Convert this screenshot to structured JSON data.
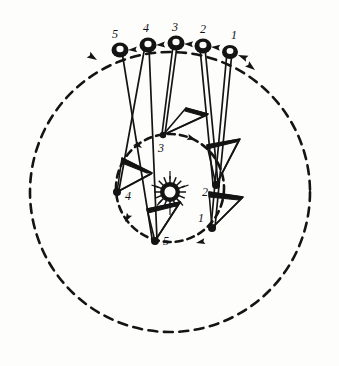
{
  "figure": {
    "background_color": "#fdfdfc",
    "ink_color": "#141414",
    "center": {
      "x": 170,
      "y": 192,
      "label": "sun-starburst"
    },
    "outer_orbit": {
      "name": "outer-dashed-orbit",
      "cx": 170,
      "cy": 192,
      "r": 140,
      "style": "dashed",
      "direction": "counter-clockwise",
      "direction_arrow_count": 3
    },
    "inner_orbit": {
      "name": "inner-dashed-orbit",
      "cx": 170,
      "cy": 188,
      "r": 54,
      "style": "dashed",
      "direction": "counter-clockwise",
      "direction_arrow_count": 4
    },
    "outer_positions": [
      {
        "label": "1",
        "x": 230,
        "y": 50,
        "label_x": 234,
        "label_y": 39
      },
      {
        "label": "2",
        "x": 203,
        "y": 45,
        "label_x": 203,
        "label_y": 33
      },
      {
        "label": "3",
        "x": 176,
        "y": 43,
        "label_x": 175,
        "label_y": 31
      },
      {
        "label": "4",
        "x": 148,
        "y": 44,
        "label_x": 146,
        "label_y": 32
      },
      {
        "label": "5",
        "x": 120,
        "y": 49,
        "label_x": 115,
        "label_y": 38
      }
    ],
    "inner_positions": [
      {
        "label": "1",
        "x": 212,
        "y": 228,
        "label_x": 201,
        "label_y": 222
      },
      {
        "label": "2",
        "x": 216,
        "y": 185,
        "label_x": 205,
        "label_y": 196
      },
      {
        "label": "3",
        "x": 163,
        "y": 135,
        "label_x": 161,
        "label_y": 152
      },
      {
        "label": "4",
        "x": 117,
        "y": 192,
        "label_x": 128,
        "label_y": 200
      },
      {
        "label": "5",
        "x": 155,
        "y": 241,
        "label_x": 166,
        "label_y": 245
      }
    ],
    "connector_lines": [
      {
        "name": "radius-line-1",
        "from": "outer-1",
        "to": "inner-1"
      },
      {
        "name": "radius-line-2",
        "from": "outer-2",
        "to": "inner-2"
      },
      {
        "name": "radius-line-3",
        "from": "outer-3",
        "to": "inner-3"
      },
      {
        "name": "radius-line-4",
        "from": "outer-4",
        "to": "inner-4"
      },
      {
        "name": "radius-line-5",
        "from": "outer-5",
        "to": "inner-5"
      }
    ],
    "wedges": [
      {
        "name": "wedge-inner-1",
        "at_label": "1"
      },
      {
        "name": "wedge-inner-2",
        "at_label": "2"
      },
      {
        "name": "wedge-inner-3",
        "at_label": "3"
      },
      {
        "name": "wedge-inner-4",
        "at_label": "4"
      },
      {
        "name": "wedge-inner-5",
        "at_label": "5"
      }
    ]
  }
}
